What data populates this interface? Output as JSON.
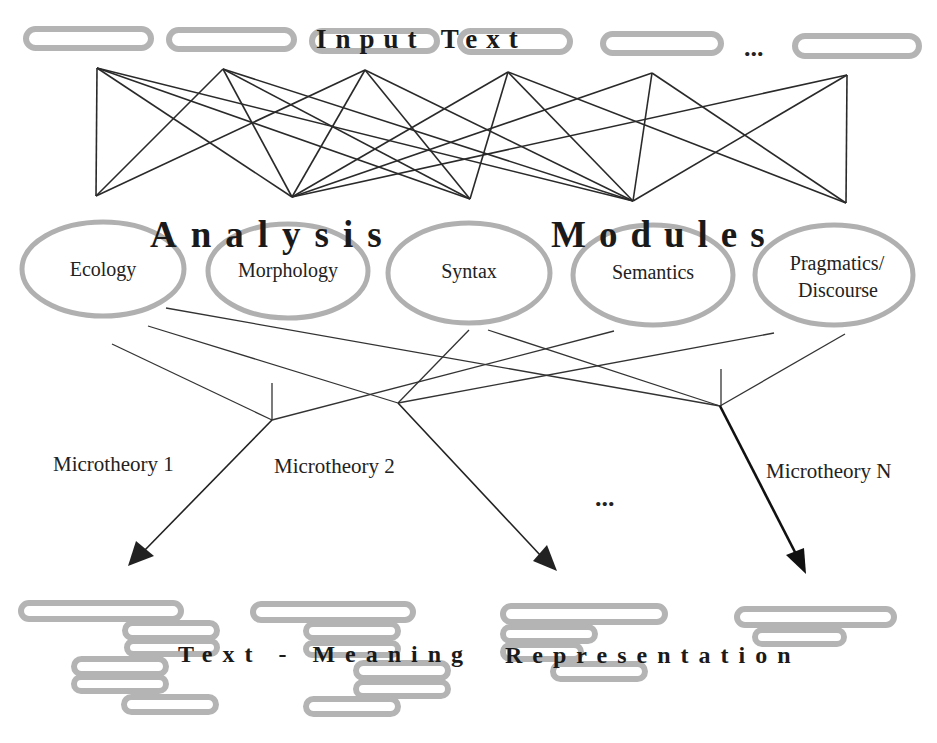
{
  "diagram": {
    "top_label": "Input Text",
    "top_ellipsis": "...",
    "modules_heading": {
      "word1": "Analysis",
      "word2": "Modules"
    },
    "modules": [
      {
        "label": "Ecology"
      },
      {
        "label": "Morphology"
      },
      {
        "label": "Syntax"
      },
      {
        "label": "Semantics"
      },
      {
        "label": "Pragmatics/",
        "label2": "Discourse"
      }
    ],
    "microtheories": [
      {
        "label": "Microtheory 1"
      },
      {
        "label": "Microtheory 2"
      },
      {
        "label": "Microtheory N"
      }
    ],
    "middle_ellipsis": "...",
    "bottom_label": {
      "part1": "Text - Meaning",
      "part2": "Representation"
    },
    "colors": {
      "pill_stroke": "#b4b4b4",
      "ellipse_stroke": "#b0b0b0",
      "line": "#2a2a2a",
      "text": "#1a1a1a",
      "background": "#ffffff"
    }
  }
}
